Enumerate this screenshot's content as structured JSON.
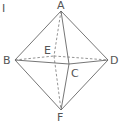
{
  "figure": {
    "label": "I",
    "shape": "octahedron"
  },
  "vertices": {
    "A": {
      "label": "A",
      "x": 61,
      "y": 11
    },
    "B": {
      "label": "B",
      "x": 15,
      "y": 60
    },
    "C": {
      "label": "C",
      "x": 69,
      "y": 64
    },
    "D": {
      "label": "D",
      "x": 108,
      "y": 60
    },
    "E": {
      "label": "E",
      "x": 54,
      "y": 56
    },
    "F": {
      "label": "F",
      "x": 61,
      "y": 110
    }
  },
  "edges": {
    "solid": [
      "AB",
      "AD",
      "AC",
      "BC",
      "CD",
      "BF",
      "DF",
      "CF"
    ],
    "dashed": [
      "AE",
      "EF",
      "BE",
      "ED"
    ]
  },
  "colors": {
    "line": "#666666",
    "text": "#555555",
    "background": "#ffffff"
  }
}
